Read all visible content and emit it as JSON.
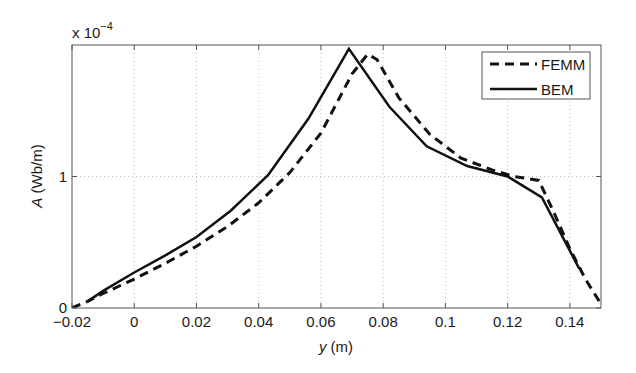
{
  "chart_data": {
    "type": "line",
    "title": "",
    "xlabel": "y (m)",
    "ylabel": "A (Wb/m)",
    "y_multiplier": "x 10^-4",
    "y_multiplier_base": "x 10",
    "y_multiplier_exp": "−4",
    "xlim": [
      -0.02,
      0.15
    ],
    "ylim": [
      0,
      2.0
    ],
    "grid": true,
    "legend_position": "upper right",
    "x_ticks": [
      -0.02,
      0,
      0.02,
      0.04,
      0.06,
      0.08,
      0.1,
      0.12,
      0.14
    ],
    "x_tick_labels": [
      "−0.02",
      "0",
      "0.02",
      "0.04",
      "0.06",
      "0.08",
      "0.1",
      "0.12",
      "0.14"
    ],
    "y_ticks": [
      0,
      1
    ],
    "y_tick_labels": [
      "0",
      "1"
    ],
    "series": [
      {
        "name": "FEMM",
        "style": "dashed",
        "color": "#111111",
        "x": [
          -0.02,
          -0.015,
          -0.01,
          0.0,
          0.01,
          0.02,
          0.03,
          0.04,
          0.05,
          0.06,
          0.07,
          0.075,
          0.078,
          0.085,
          0.095,
          0.105,
          0.115,
          0.122,
          0.13,
          0.135,
          0.14,
          0.145,
          0.15
        ],
        "values": [
          0.0,
          0.05,
          0.11,
          0.22,
          0.34,
          0.47,
          0.62,
          0.8,
          1.03,
          1.33,
          1.78,
          1.93,
          1.89,
          1.6,
          1.32,
          1.14,
          1.05,
          1.0,
          0.97,
          0.72,
          0.45,
          0.22,
          0.03
        ]
      },
      {
        "name": "BEM",
        "style": "solid",
        "color": "#111111",
        "x": [
          -0.015,
          -0.01,
          0.0,
          0.01,
          0.02,
          0.031,
          0.043,
          0.056,
          0.069,
          0.082,
          0.094,
          0.107,
          0.12,
          0.131,
          0.143
        ],
        "values": [
          0.05,
          0.13,
          0.27,
          0.4,
          0.54,
          0.74,
          1.01,
          1.44,
          1.97,
          1.53,
          1.23,
          1.08,
          1.0,
          0.84,
          0.3
        ]
      }
    ]
  }
}
